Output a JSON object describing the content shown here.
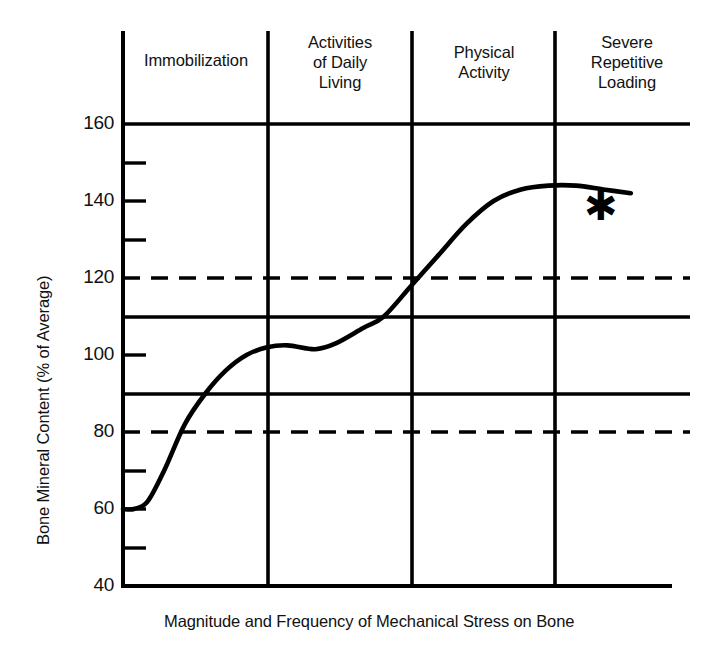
{
  "chart_data": {
    "type": "line",
    "title": "",
    "xlabel": "Magnitude and Frequency of Mechanical Stress on Bone",
    "ylabel": "Bone Mineral Content (% of Average)",
    "ylim": [
      40,
      160
    ],
    "ytick_labels": [
      "160",
      "140",
      "120",
      "100",
      "80",
      "60",
      "40"
    ],
    "yticks_major": [
      160,
      140,
      120,
      100,
      80,
      60,
      40
    ],
    "yticks_minor": [
      150,
      130,
      110,
      90,
      70,
      50
    ],
    "grid": "horizontal solid gridlines at 160, 110, 90 and dashed gridlines at 120, 80; vertical solid band dividers",
    "gridlines_solid": [
      160,
      110,
      90
    ],
    "gridlines_dashed": [
      120,
      80
    ],
    "legend": "none",
    "annotations": [
      {
        "text": "*",
        "x_band": "Severe Repetitive Loading",
        "value": 140,
        "note": "asterisk marking severe repetitive loading region"
      }
    ],
    "x_categories": [
      "Immobilization",
      "Activities of Daily Living",
      "Physical Activity",
      "Severe Repetitive Loading"
    ],
    "series": [
      {
        "name": "Bone Mineral Content",
        "points": [
          {
            "x": 0.0,
            "y": 60
          },
          {
            "x": 0.08,
            "y": 60
          },
          {
            "x": 0.18,
            "y": 62
          },
          {
            "x": 0.3,
            "y": 70
          },
          {
            "x": 0.45,
            "y": 82
          },
          {
            "x": 0.6,
            "y": 90
          },
          {
            "x": 0.75,
            "y": 96
          },
          {
            "x": 0.9,
            "y": 100
          },
          {
            "x": 1.05,
            "y": 102
          },
          {
            "x": 1.2,
            "y": 102.5
          },
          {
            "x": 1.4,
            "y": 101.5
          },
          {
            "x": 1.55,
            "y": 103
          },
          {
            "x": 1.75,
            "y": 107
          },
          {
            "x": 1.9,
            "y": 110
          },
          {
            "x": 2.1,
            "y": 118
          },
          {
            "x": 2.3,
            "y": 126
          },
          {
            "x": 2.5,
            "y": 134
          },
          {
            "x": 2.7,
            "y": 140
          },
          {
            "x": 2.9,
            "y": 143
          },
          {
            "x": 3.1,
            "y": 144
          },
          {
            "x": 3.3,
            "y": 144
          },
          {
            "x": 3.5,
            "y": 143
          },
          {
            "x": 3.7,
            "y": 142
          }
        ]
      }
    ]
  },
  "bands": [
    {
      "id": "immobilization",
      "label": "Immobilization"
    },
    {
      "id": "activities-of-daily-living",
      "label": "Activities\nof Daily\nLiving"
    },
    {
      "id": "physical-activity",
      "label": "Physical\nActivity"
    },
    {
      "id": "severe-repetitive-loading",
      "label": "Severe\nRepetitive\nLoading"
    }
  ],
  "y_labels": {
    "t160": "160",
    "t140": "140",
    "t120": "120",
    "t100": "100",
    "t80": "80",
    "t60": "60",
    "t40": "40"
  },
  "axis_titles": {
    "x": "Magnitude and Frequency of Mechanical Stress on Bone",
    "y": "Bone Mineral Content (% of Average)"
  },
  "marker": {
    "asterisk": "✱"
  },
  "colors": {
    "ink": "#000000",
    "background": "#ffffff"
  }
}
